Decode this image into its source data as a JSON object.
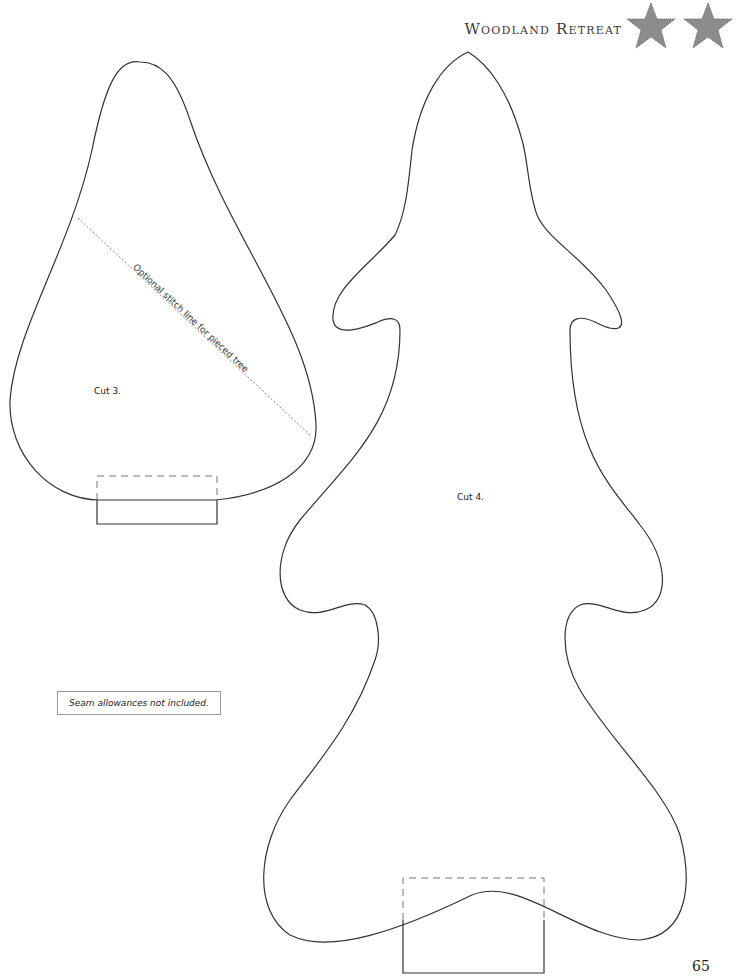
{
  "header": {
    "title": "Woodland Retreat",
    "icons": [
      "star-icon",
      "star-icon"
    ],
    "star_color": "#8c8c8c"
  },
  "patterns": {
    "small_tree": {
      "cut_label": "Cut 3.",
      "stitch_line_label": "Optional stitch line for pieced tree"
    },
    "large_tree": {
      "cut_label": "Cut 4."
    }
  },
  "note": "Seam allowances not included.",
  "page_number": "65",
  "colors": {
    "outline": "#333333",
    "dashed": "#777777",
    "stitch": "#888888"
  }
}
